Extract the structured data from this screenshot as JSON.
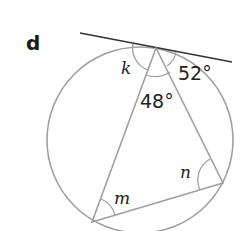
{
  "problem": {
    "part_label": "d"
  },
  "diagram": {
    "angles": {
      "k": "k",
      "tangent_right": "52°",
      "apex": "48°",
      "n": "n",
      "m": "m"
    },
    "colors": {
      "circle": "#9a9a9a",
      "tangent": "#333333",
      "triangle": "#9a9a9a",
      "text": "#222222"
    }
  }
}
